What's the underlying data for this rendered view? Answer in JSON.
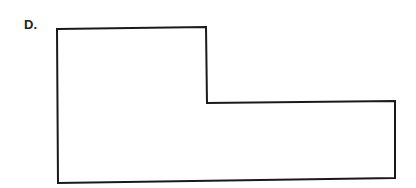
{
  "figure": {
    "label": "D.",
    "shape": {
      "name": "L-shaped polygon",
      "stroke": "#1a1a1a",
      "fill": "#ffffff",
      "points": "57,29 206,27 207,103 395,101 395,178 58,183"
    }
  }
}
